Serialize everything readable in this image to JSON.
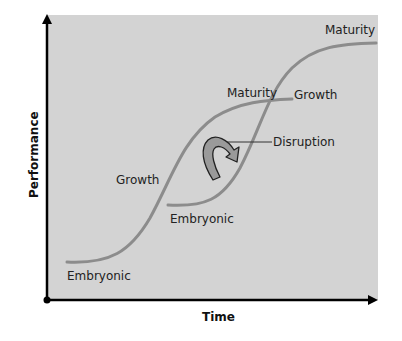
{
  "diagram": {
    "type": "technology-s-curves",
    "axes": {
      "x_label": "Time",
      "y_label": "Performance"
    },
    "curves": [
      {
        "name": "first technology",
        "stages": [
          "Embryonic",
          "Growth",
          "Maturity"
        ]
      },
      {
        "name": "second technology",
        "stages": [
          "Embryonic",
          "Growth",
          "Maturity"
        ]
      }
    ],
    "labels": {
      "curve1_embryonic": "Embryonic",
      "curve1_growth": "Growth",
      "curve1_maturity": "Maturity",
      "curve2_embryonic": "Embryonic",
      "curve2_growth": "Growth",
      "curve2_maturity": "Maturity",
      "disruption": "Disruption"
    },
    "colors": {
      "background": "#d3d3d3",
      "curve": "#8c8c8c",
      "axis": "#000000",
      "arrow_fill": "#9a9a9a",
      "text": "#222222"
    }
  }
}
